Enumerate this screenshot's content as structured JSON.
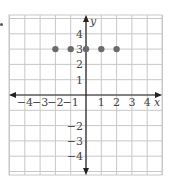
{
  "chart_data": {
    "type": "scatter",
    "title": "",
    "xlabel": "x",
    "ylabel": "y",
    "xlim": [
      -5,
      5
    ],
    "ylim": [
      -5,
      5
    ],
    "grid": true,
    "x_ticks": [
      -4,
      -3,
      -2,
      -1,
      1,
      2,
      3,
      4
    ],
    "y_ticks": [
      -4,
      -3,
      -2,
      1,
      2,
      3,
      4
    ],
    "x_tick_labels": [
      "−4",
      "−3",
      "−2",
      "−1",
      "1",
      "2",
      "3",
      "4"
    ],
    "y_tick_labels": [
      "−4",
      "−3",
      "−2",
      "1",
      "2",
      "3",
      "4"
    ],
    "series": [
      {
        "name": "points",
        "x": [
          -2,
          -1,
          0,
          1,
          2
        ],
        "y": [
          3,
          3,
          3,
          3,
          3
        ],
        "color": "#6b6b6b"
      }
    ]
  },
  "colors": {
    "grid": "#c8c8c8",
    "axis": "#222222",
    "point": "#6b6b6b"
  }
}
